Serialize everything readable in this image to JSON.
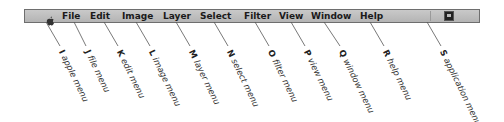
{
  "menubar": {
    "items": [
      {
        "id": "apple",
        "label": "",
        "icon": "apple-icon",
        "x": 22
      },
      {
        "id": "file",
        "label": "File",
        "x": 61
      },
      {
        "id": "edit",
        "label": "Edit",
        "x": 89
      },
      {
        "id": "image",
        "label": "Image",
        "x": 121
      },
      {
        "id": "layer",
        "label": "Layer",
        "x": 162
      },
      {
        "id": "select",
        "label": "Select",
        "x": 199
      },
      {
        "id": "filter",
        "label": "Filter",
        "x": 243
      },
      {
        "id": "view",
        "label": "View",
        "x": 278
      },
      {
        "id": "window",
        "label": "Window",
        "x": 310
      },
      {
        "id": "help",
        "label": "Help",
        "x": 359
      },
      {
        "id": "application",
        "label": "",
        "icon": "application-menu-icon",
        "x": 424
      }
    ]
  },
  "callouts": [
    {
      "letter": "I",
      "text": "apple menu",
      "from_x": 46,
      "to_x": 60
    },
    {
      "letter": "J",
      "text": "file menu",
      "from_x": 74,
      "to_x": 86
    },
    {
      "letter": "K",
      "text": "edit menu",
      "from_x": 104,
      "to_x": 118
    },
    {
      "letter": "L",
      "text": "image menu",
      "from_x": 136,
      "to_x": 150
    },
    {
      "letter": "M",
      "text": "layer menu",
      "from_x": 176,
      "to_x": 190
    },
    {
      "letter": "N",
      "text": "select menu",
      "from_x": 214,
      "to_x": 228
    },
    {
      "letter": "O",
      "text": "filter menu",
      "from_x": 255,
      "to_x": 269
    },
    {
      "letter": "P",
      "text": "view menu",
      "from_x": 291,
      "to_x": 305
    },
    {
      "letter": "Q",
      "text": "window menu",
      "from_x": 324,
      "to_x": 340
    },
    {
      "letter": "R",
      "text": "help menu",
      "from_x": 370,
      "to_x": 384
    },
    {
      "letter": "S",
      "text": "application menu",
      "from_x": 427,
      "to_x": 441
    }
  ],
  "colors": {
    "menubar_bg": "#bdbdbd",
    "menubar_border": "#6e6e6e",
    "leader_line": "#555555",
    "label_text": "#333333"
  }
}
